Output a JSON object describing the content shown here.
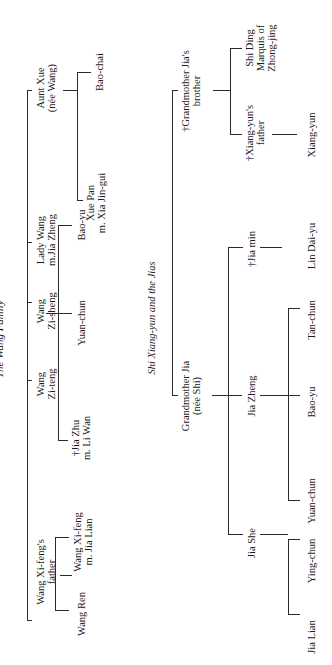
{
  "wang_family": {
    "title": "The Wang Family",
    "members": {
      "aunt_xue": [
        "Aunt Xue",
        "(née Wang)"
      ],
      "lady_wang": [
        "Lady Wang",
        "m.Jia Zheng"
      ],
      "wang_zi_sheng": [
        "Wang",
        "Zi-sheng"
      ],
      "wang_zi_teng": [
        "Wang",
        "Zi-teng"
      ],
      "wang_xi_feng_father": [
        "Wang Xi-feng's",
        "father"
      ]
    },
    "children": {
      "bao_chai": "Bao-chai",
      "xue_pan": [
        "Xue Pan",
        "m. Xia Jin-gui"
      ],
      "bao_yu": "Bao-yu",
      "yuan_chun": "Yuan-chun",
      "jia_zhu": [
        "†Jia Zhu",
        "m. Li Wan"
      ],
      "wang_xi_feng": [
        "Wang Xi-feng",
        "m. Jia Lian"
      ],
      "wang_ren": "Wang Ren"
    }
  },
  "shi_jia": {
    "title": "Shi Xiang-yun and the Jias",
    "grandmother_jia": [
      "Grandmother Jia",
      "(née Shi)"
    ],
    "grandmother_brother": [
      "†Grandmother Jia's",
      "brother"
    ],
    "shi_ding": [
      "Shi Ding",
      "Marquis of",
      "Zhong-jing"
    ],
    "xiang_yun_father": [
      "†Xiang-yun's",
      "father"
    ],
    "xiang_yun": "Xiang-yun",
    "jia_min": "†Jia min",
    "lin_dai_yu": "Lin Dai-yu",
    "jia_zheng": "Jia Zheng",
    "tan_chun": "Tan-chun",
    "bao_yu": "Bao-yu",
    "yuan_chun": "Yuan-chun",
    "jia_she": "Jia She",
    "ying_chun": "Ying-chun",
    "jia_lian": "Jia Lian"
  }
}
